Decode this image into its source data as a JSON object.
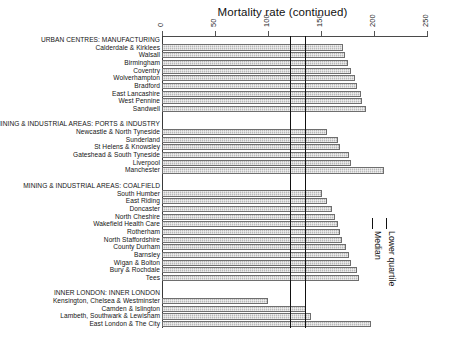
{
  "chart_data": {
    "type": "bar",
    "orientation": "horizontal",
    "title": "Mortality rate (continued)",
    "xlabel": "",
    "ylabel": "",
    "xlim": [
      0,
      250
    ],
    "xticks": [
      0,
      50,
      100,
      150,
      200,
      250
    ],
    "xticklabels": [
      "0",
      "50",
      "100",
      "150",
      "200",
      "250"
    ],
    "axis_position": "top",
    "grid": false,
    "legend_position": "right",
    "reference_lines": [
      {
        "name": "Lower quartile",
        "value": 121
      },
      {
        "name": "Median",
        "value": 135
      }
    ],
    "groups": [
      {
        "name": "URBAN CENTRES: MANUFACTURING",
        "categories": [
          "Calderdale & Kirklees",
          "Walsall",
          "Birmingham",
          "Coventry",
          "Wolverhampton",
          "Bradford",
          "East Lancashire",
          "West Pennine",
          "Sandwell"
        ],
        "values": [
          171,
          173,
          175,
          178,
          182,
          184,
          188,
          189,
          192
        ]
      },
      {
        "name": "MINING & INDUSTRIAL AREAS: PORTS & INDUSTRY",
        "categories": [
          "Newcastle & North Tyneside",
          "Sunderland",
          "St Helens & Knowsley",
          "Gateshead & South Tyneside",
          "Liverpool",
          "Manchester"
        ],
        "values": [
          156,
          166,
          168,
          176,
          178,
          209
        ]
      },
      {
        "name": "MINING & INDUSTRIAL AREAS: COALFIELD",
        "categories": [
          "South Humber",
          "East Riding",
          "Doncaster",
          "North Cheshire",
          "Wakefield Health Care",
          "Rotherham",
          "North Staffordshire",
          "County Durham",
          "Barnsley",
          "Wigan & Bolton",
          "Bury & Rochdale",
          "Tees"
        ],
        "values": [
          151,
          156,
          160,
          163,
          166,
          168,
          170,
          174,
          176,
          178,
          184,
          186
        ]
      },
      {
        "name": "INNER LONDON: INNER LONDON",
        "categories": [
          "Kensington, Chelsea & Westminster",
          "Camden & Islington",
          "Lambeth, Southwark & Lewisham",
          "East London & The City"
        ],
        "values": [
          100,
          136,
          141,
          197
        ]
      }
    ],
    "legend": [
      "Median",
      "Lower quartile"
    ],
    "colors": {
      "bar_fill": "#b9b9b9",
      "bar_edge": "#6e6e6e",
      "reference_line": "#111111",
      "axis": "#4a4a4a",
      "text": "#141414"
    }
  }
}
